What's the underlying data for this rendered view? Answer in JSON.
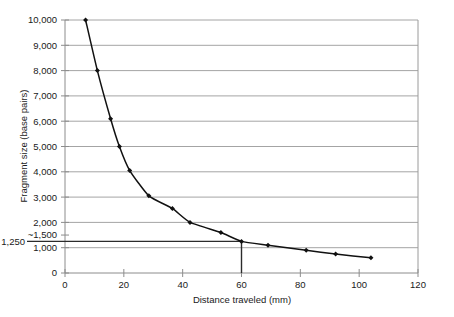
{
  "chart_data": {
    "type": "line",
    "title": "",
    "xlabel": "Distance traveled (mm)",
    "ylabel": "Fragment size (base pairs)",
    "xlim": [
      0,
      120
    ],
    "ylim": [
      0,
      10000
    ],
    "grid": true,
    "legend": "none",
    "x_ticks": [
      0,
      20,
      40,
      60,
      80,
      100,
      120
    ],
    "x_tick_labels": [
      "0",
      "20",
      "40",
      "60",
      "80",
      "100",
      "120"
    ],
    "y_ticks": [
      0,
      1000,
      1500,
      2000,
      3000,
      4000,
      5000,
      6000,
      7000,
      8000,
      9000,
      10000
    ],
    "y_tick_labels": [
      "0",
      "1,000",
      "~1,500",
      "2,000",
      "3,000",
      "4,000",
      "5,000",
      "6,000",
      "7,000",
      "8,000",
      "9,000",
      "10,000"
    ],
    "x": [
      7,
      11,
      15.5,
      18.5,
      22,
      28.5,
      36.5,
      42.5,
      53,
      60,
      69,
      82,
      92,
      104
    ],
    "values": [
      10000,
      8000,
      6100,
      5000,
      4050,
      3050,
      2550,
      2000,
      1600,
      1250,
      1100,
      900,
      750,
      600
    ],
    "series": [
      {
        "name": "DNA size standard",
        "x": [
          7,
          11,
          15.5,
          18.5,
          22,
          28.5,
          36.5,
          42.5,
          53,
          60,
          69,
          82,
          92,
          104
        ],
        "values": [
          10000,
          8000,
          6100,
          5000,
          4050,
          3050,
          2550,
          2000,
          1600,
          1250,
          1100,
          900,
          750,
          600
        ]
      }
    ],
    "annotations": [
      {
        "name": "unknown-fragment-reference",
        "label": "1,250",
        "type": "crosshair",
        "x": 60,
        "y": 1250,
        "horizontal_line_from_x": 0,
        "vertical_line_to_y": 0
      },
      {
        "name": "approx-1500-marker",
        "label": "~1,500",
        "type": "y-tick",
        "y": 1500
      }
    ],
    "colors": {
      "series_line": "#111111",
      "marker": "#111111",
      "gridline": "#9a9a9a",
      "axis": "#8c8c8c",
      "reference_line": "#2b2b2b",
      "text": "#1a1a1a",
      "background": "#ffffff"
    }
  }
}
